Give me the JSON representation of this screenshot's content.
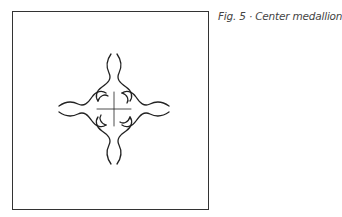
{
  "figure": {
    "caption": "Fig. 5 · Center medallion",
    "stroke_color": "#222222",
    "frame_color": "#333333"
  }
}
